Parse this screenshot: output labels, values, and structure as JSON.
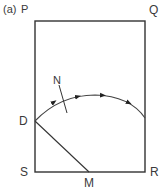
{
  "figure": {
    "part_label": "(a)",
    "corners": {
      "top_left": "P",
      "top_right": "Q",
      "bottom_left": "S",
      "bottom_right": "R"
    },
    "points": {
      "d": "D",
      "m": "M",
      "n": "N"
    },
    "colors": {
      "line": "#333333",
      "background": "#ffffff"
    }
  }
}
